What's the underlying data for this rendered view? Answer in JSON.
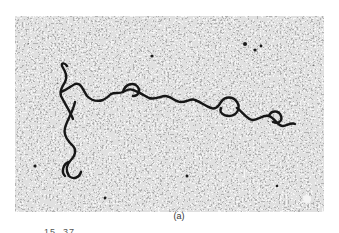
{
  "figure": {
    "type": "electron-micrograph",
    "panel_label": "(a)",
    "colors": {
      "background_noise_light": "#e6e6e6",
      "background_noise_dark": "#3a3a3a",
      "strand": "#151515"
    }
  },
  "footer": {
    "clipped_text": "15. 37"
  }
}
